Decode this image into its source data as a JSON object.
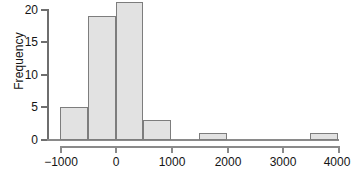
{
  "chart_data": {
    "type": "bar",
    "title": "",
    "subtitle": "",
    "xlabel": "",
    "ylabel": "Frequency",
    "xlim": [
      -1250,
      4000
    ],
    "ylim": [
      0,
      21.5
    ],
    "grid": false,
    "legend": null,
    "bin_width": 500,
    "bin_edges": [
      -1000,
      -500,
      0,
      500,
      1000,
      1500,
      2000,
      2500,
      3000,
      3500,
      4000
    ],
    "categories": [
      "-1000 to -500",
      "-500 to 0",
      "0 to 500",
      "500 to 1000",
      "1000 to 1500",
      "1500 to 2000",
      "2000 to 2500",
      "2500 to 3000",
      "3000 to 3500",
      "3500 to 4000"
    ],
    "values": [
      5,
      19,
      21,
      3,
      0,
      1,
      0,
      0,
      0,
      1
    ],
    "x_ticks": [
      -1000,
      0,
      1000,
      2000,
      3000,
      4000
    ],
    "x_tick_labels": [
      "−1000",
      "0",
      "1000",
      "2000",
      "3000",
      "4000"
    ],
    "y_ticks": [
      0,
      5,
      10,
      15,
      20
    ],
    "y_tick_labels": [
      "0",
      "5",
      "10",
      "15",
      "20"
    ],
    "bar_fill": "#e2e2e2",
    "bar_edge": "#7d7d7d",
    "axis_color": "#8a8a8a"
  },
  "axes": {
    "y_title": "Frequency",
    "x_title": ""
  }
}
